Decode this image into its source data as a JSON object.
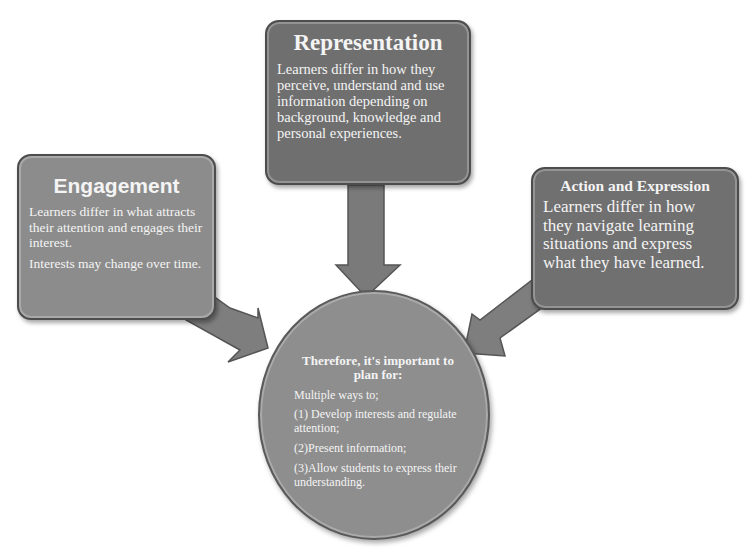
{
  "diagram": {
    "representation": {
      "title": "Representation",
      "body": "Learners differ in how they perceive, understand and use information depending on background, knowledge and personal experiences."
    },
    "engagement": {
      "title": "Engagement",
      "body": [
        "Learners differ in what attracts their attention and engages their interest.",
        "Interests may change over time."
      ]
    },
    "action_expression": {
      "title": "Action and Expression",
      "body": "Learners differ in how they navigate learning situations and express what they have learned."
    },
    "center": {
      "title": "Therefore, it's important to plan for:",
      "items": [
        "Multiple ways to;",
        "(1) Develop interests and regulate attention;",
        "(2)Present information;",
        "(3)Allow students to express their understanding."
      ]
    },
    "colors": {
      "box_dark": "#6f6f6f",
      "box_light": "#8c8c8c",
      "arrow": "#7a7a7a",
      "text": "#f4f4f4"
    }
  }
}
